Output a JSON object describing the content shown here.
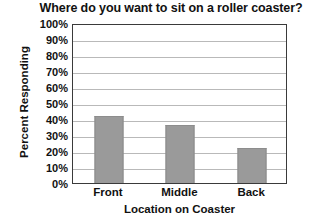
{
  "chart_data": {
    "type": "bar",
    "title": "Where do you want to sit on a roller coaster?",
    "xlabel": "Location on Coaster",
    "ylabel": "Percent Responding",
    "categories": [
      "Front",
      "Middle",
      "Back"
    ],
    "values": [
      42,
      36,
      22
    ],
    "ylim": [
      0,
      100
    ],
    "ytick_labels": [
      "100%",
      "90%",
      "80%",
      "70%",
      "60%",
      "50%",
      "40%",
      "30%",
      "20%",
      "10%",
      "0%"
    ],
    "ytick_values": [
      100,
      90,
      80,
      70,
      60,
      50,
      40,
      30,
      20,
      10,
      0
    ],
    "grid": true,
    "legend": false,
    "bar_color": "#9a9a9a",
    "bar_edge_color": "#8a8a8a",
    "axis_color": "#3a3a3a",
    "gridline_color": "#b9b9b9",
    "background_color": "#ffffff"
  }
}
